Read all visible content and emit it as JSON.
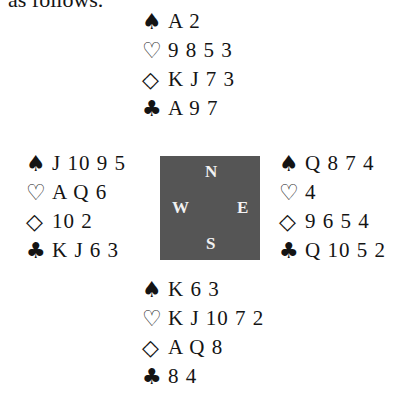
{
  "intro_text": "as follows.",
  "suits": {
    "spades": "♠",
    "hearts": "♡",
    "diamonds": "◇",
    "clubs": "♣"
  },
  "hands": {
    "north": {
      "spades": "A 2",
      "hearts": "9 8 5 3",
      "diamonds": "K J 7 3",
      "clubs": "A 9 7"
    },
    "west": {
      "spades": "J 10 9 5",
      "hearts": "A Q 6",
      "diamonds": "10 2",
      "clubs": "K J 6 3"
    },
    "east": {
      "spades": "Q 8 7 4",
      "hearts": "4",
      "diamonds": "9 6 5 4",
      "clubs": "Q 10 5 2"
    },
    "south": {
      "spades": "K 6 3",
      "hearts": "K J 10 7 2",
      "diamonds": "A Q 8",
      "clubs": "8 4"
    }
  },
  "compass": {
    "north": "N",
    "west": "W",
    "east": "E",
    "south": "S"
  }
}
